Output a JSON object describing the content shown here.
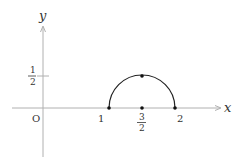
{
  "diagram": {
    "type": "coordinate-plot",
    "axes": {
      "x_label": "x",
      "y_label": "y",
      "origin_label": "O"
    },
    "x_ticks": [
      {
        "label": "1",
        "value": 1
      },
      {
        "label_num": "3",
        "label_den": "2",
        "value": 1.5
      },
      {
        "label": "2",
        "value": 2
      }
    ],
    "y_ticks": [
      {
        "label_num": "1",
        "label_den": "2",
        "value": 0.5
      }
    ],
    "curve": {
      "description": "upper semicircle centered at (3/2, 0) with radius 1/2",
      "center": [
        1.5,
        0
      ],
      "radius": 0.5,
      "endpoints": [
        [
          1,
          0
        ],
        [
          2,
          0
        ]
      ],
      "top": [
        1.5,
        0.5
      ]
    },
    "points": [
      [
        1,
        0
      ],
      [
        1.5,
        0
      ],
      [
        2,
        0
      ],
      [
        1.5,
        0.5
      ]
    ],
    "colors": {
      "axis": "#b0b0b0",
      "curve": "#222222",
      "text": "#333333"
    }
  }
}
